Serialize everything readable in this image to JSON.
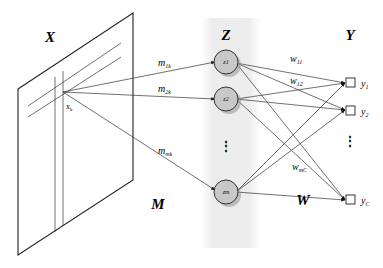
{
  "diagram": {
    "sections": {
      "input_label": "X",
      "hidden_label": "Z",
      "output_label": "Y",
      "input_weights_label": "M",
      "output_weights_label": "W"
    },
    "input": {
      "point_label": "xk"
    },
    "input_weights": [
      {
        "label": "m1k",
        "base": "m",
        "sub": "1k"
      },
      {
        "label": "m2k",
        "base": "m",
        "sub": "2k"
      },
      {
        "label": "mmk",
        "base": "m",
        "sub": "mk"
      }
    ],
    "hidden_nodes": [
      {
        "label": "z1"
      },
      {
        "label": "z2"
      },
      {
        "label": "zm"
      }
    ],
    "hidden_ellipsis": "⋮",
    "output_weights": [
      {
        "label": "w11",
        "base": "w",
        "sub": "11"
      },
      {
        "label": "w12",
        "base": "w",
        "sub": "12"
      },
      {
        "label": "wmC",
        "base": "w",
        "sub": "mC"
      }
    ],
    "output_nodes": [
      {
        "label": "y1",
        "base": "y",
        "sub": "1"
      },
      {
        "label": "y2",
        "base": "y",
        "sub": "2"
      },
      {
        "label": "yC",
        "base": "y",
        "sub": "C"
      }
    ],
    "output_ellipsis": "⋮",
    "colors": {
      "node_fill": "#c8c8c8",
      "node_shadow": "#9a9a9a",
      "panel_bg": "#eeeeee",
      "line": "#333333"
    }
  }
}
